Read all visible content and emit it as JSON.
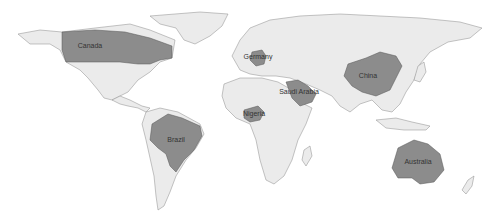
{
  "map": {
    "type": "world-choropleth",
    "colors": {
      "background": "#ffffff",
      "land": "#ebebeb",
      "border": "#8a8a8a",
      "highlight": "#8c8c8c",
      "label": "#333333"
    },
    "highlighted_countries": [
      {
        "name": "Canada",
        "label": "Canada",
        "x": 90,
        "y": 48
      },
      {
        "name": "Germany",
        "label": "Germany",
        "x": 258,
        "y": 59
      },
      {
        "name": "Saudi Arabia",
        "label": "Saudi Arabia",
        "x": 299,
        "y": 94
      },
      {
        "name": "China",
        "label": "China",
        "x": 368,
        "y": 78
      },
      {
        "name": "Nigeria",
        "label": "Nigeria",
        "x": 252,
        "y": 114
      },
      {
        "name": "Brazil",
        "label": "Brazil",
        "x": 173,
        "y": 142
      },
      {
        "name": "Australia",
        "label": "Australia",
        "x": 412,
        "y": 163
      }
    ]
  }
}
